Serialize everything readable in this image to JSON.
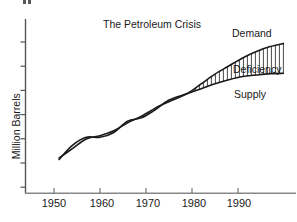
{
  "chart_data": {
    "type": "line",
    "title": "The Petroleum Crisis",
    "xlabel": "",
    "ylabel": "Million Barrels",
    "xlim": [
      1944,
      2000
    ],
    "ylim": [
      0,
      10
    ],
    "grid": false,
    "legend_position": "inline-right",
    "xticks": [
      "1950",
      "1960",
      "1970",
      "1980",
      "1990"
    ],
    "xtick_values": [
      1950,
      1960,
      1970,
      1980,
      1990
    ],
    "ytick_count": 7,
    "ytick_labels": [],
    "annotations": [
      "Demand",
      "Deficiency",
      "Supply"
    ],
    "shaded_region": {
      "label": "Deficiency",
      "hatch": "vertical",
      "between": [
        "Demand",
        "Supply"
      ],
      "x_start": 1979,
      "x_end": 2000
    },
    "series": [
      {
        "name": "Demand",
        "x": [
          1951,
          1954,
          1957,
          1960,
          1963,
          1966,
          1969,
          1972,
          1975,
          1979,
          1982,
          1985,
          1988,
          1991,
          1994,
          1997,
          2000
        ],
        "values": [
          2.15,
          2.75,
          3.35,
          3.55,
          3.85,
          4.35,
          4.75,
          5.25,
          5.65,
          6.15,
          6.75,
          7.35,
          7.85,
          8.35,
          8.75,
          9.05,
          9.25
        ]
      },
      {
        "name": "Supply",
        "x": [
          1951,
          1954,
          1957,
          1960,
          1963,
          1966,
          1969,
          1972,
          1975,
          1979,
          1982,
          1985,
          1988,
          1991,
          1994,
          1997,
          2000
        ],
        "values": [
          2.05,
          2.95,
          3.45,
          3.45,
          3.75,
          4.45,
          4.65,
          5.15,
          5.75,
          6.15,
          6.45,
          6.75,
          7.0,
          7.2,
          7.3,
          7.38,
          7.4
        ]
      }
    ]
  },
  "axis": {
    "x_tick_1": "1950",
    "x_tick_2": "1960",
    "x_tick_3": "1970",
    "x_tick_4": "1980",
    "x_tick_5": "1990"
  },
  "labels": {
    "demand": "Demand",
    "deficiency": "Deficiency",
    "supply": "Supply"
  },
  "colors": {
    "ink": "#1a1a1a",
    "axis": "#555555",
    "hatch": "#2b2b2b",
    "background": "#ffffff"
  }
}
